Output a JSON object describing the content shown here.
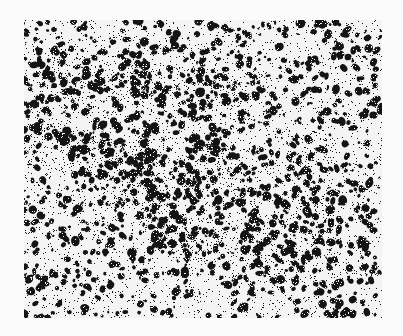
{
  "image": {
    "description": "Grainy high-contrast micrograph-like texture of dark speckles on white",
    "width": 403,
    "height": 336,
    "background": "#fbfbfb",
    "field": {
      "x": 24,
      "y": 20,
      "width": 358,
      "height": 298,
      "ink_color": "#141414",
      "paper_color": "#f4f4f4"
    },
    "dense_bands": [
      {
        "x0": 0.05,
        "y0": 0.4,
        "x1": 0.45,
        "y1": 0.5,
        "w": 0.06
      },
      {
        "x0": 0.3,
        "y0": 0.55,
        "x1": 0.45,
        "y1": 0.75,
        "w": 0.05
      },
      {
        "x0": 0.55,
        "y0": 0.45,
        "x1": 0.7,
        "y1": 0.85,
        "w": 0.04
      },
      {
        "x0": 0.8,
        "y0": 0.4,
        "x1": 0.85,
        "y1": 0.8,
        "w": 0.04
      },
      {
        "x0": 0.4,
        "y0": 0.75,
        "x1": 0.6,
        "y1": 0.75,
        "w": 0.03
      },
      {
        "x0": 0.1,
        "y0": 0.2,
        "x1": 0.6,
        "y1": 0.25,
        "w": 0.05
      }
    ],
    "seed": 1337
  }
}
